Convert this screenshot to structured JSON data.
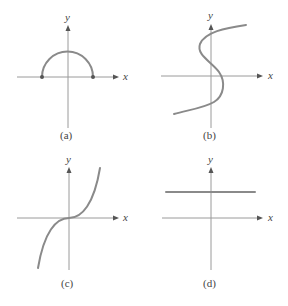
{
  "figure": {
    "panels": [
      {
        "id": "a",
        "caption": "(a)",
        "x_label": "x",
        "y_label": "y",
        "description": "upper semicircle with endpoints on x-axis"
      },
      {
        "id": "b",
        "caption": "(b)",
        "x_label": "x",
        "y_label": "y",
        "description": "S-shaped curve, x as cubic function of y"
      },
      {
        "id": "c",
        "caption": "(c)",
        "x_label": "x",
        "y_label": "y",
        "description": "cubic curve y = x^3"
      },
      {
        "id": "d",
        "caption": "(d)",
        "x_label": "x",
        "y_label": "y",
        "description": "horizontal line above x-axis"
      }
    ]
  },
  "colors": {
    "axis": "#9a9a9a",
    "curve": "#8a8a8a",
    "text": "#444444"
  }
}
